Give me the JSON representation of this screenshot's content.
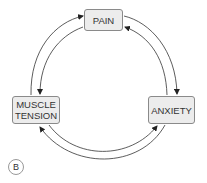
{
  "diagram": {
    "type": "cycle",
    "nodes": [
      {
        "id": "pain",
        "label": "PAIN"
      },
      {
        "id": "anxiety",
        "label": "ANXIETY"
      },
      {
        "id": "muscle_tension",
        "label_line1": "MUSCLE",
        "label_line2": "TENSION"
      }
    ],
    "edges": [
      {
        "from": "pain",
        "to": "anxiety"
      },
      {
        "from": "anxiety",
        "to": "pain"
      },
      {
        "from": "anxiety",
        "to": "muscle_tension"
      },
      {
        "from": "muscle_tension",
        "to": "anxiety"
      },
      {
        "from": "muscle_tension",
        "to": "pain"
      },
      {
        "from": "pain",
        "to": "muscle_tension"
      }
    ],
    "panel_label": "B",
    "colors": {
      "box_fill": "#ececec",
      "box_border": "#8a8a8a",
      "arrow": "#222222",
      "text": "#333333"
    }
  }
}
